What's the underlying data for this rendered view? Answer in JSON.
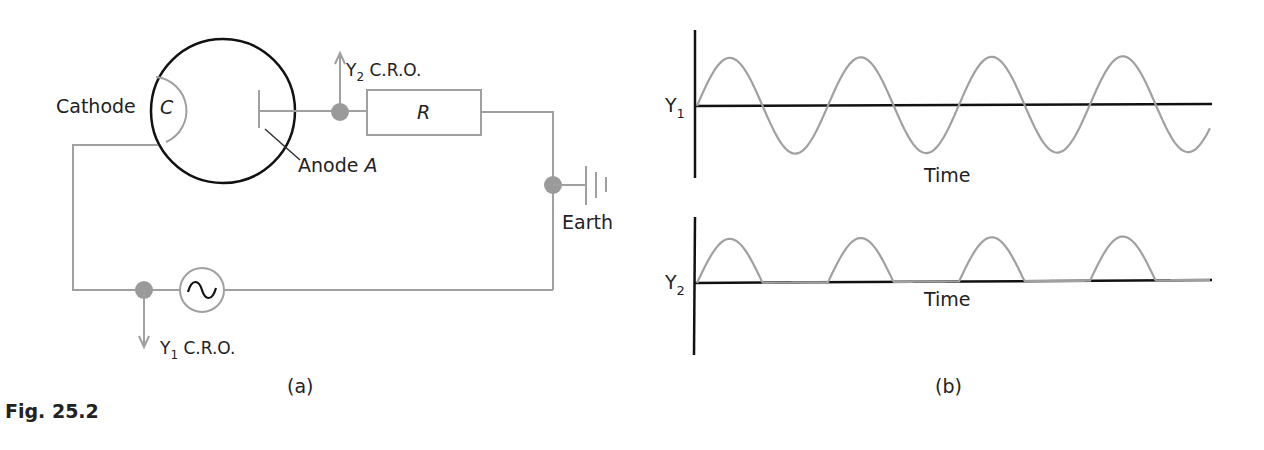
{
  "figure": {
    "caption": "Fig. 25.2",
    "panel_a_label": "(a)",
    "panel_b_label": "(b)"
  },
  "circuit": {
    "cathode_label": "Cathode",
    "cathode_symbol": "C",
    "anode_label": "Anode ",
    "anode_symbol": "A",
    "resistor_symbol": "R",
    "earth_label": "Earth",
    "y2_label": "Y",
    "y2_sub": "2",
    "y2_suffix": " C.R.O.",
    "y1_label": "Y",
    "y1_sub": "1",
    "y1_suffix": " C.R.O.",
    "ac_source_icon": "sine-wave-icon"
  },
  "graphs": {
    "top": {
      "ylabel": "Y",
      "ylabel_sub": "1",
      "xlabel": "Time"
    },
    "bottom": {
      "ylabel": "Y",
      "ylabel_sub": "2",
      "xlabel": "Time"
    }
  },
  "colors": {
    "wire": "#a0a0a0",
    "ink": "#111111",
    "dot": "#9a9a9a"
  }
}
